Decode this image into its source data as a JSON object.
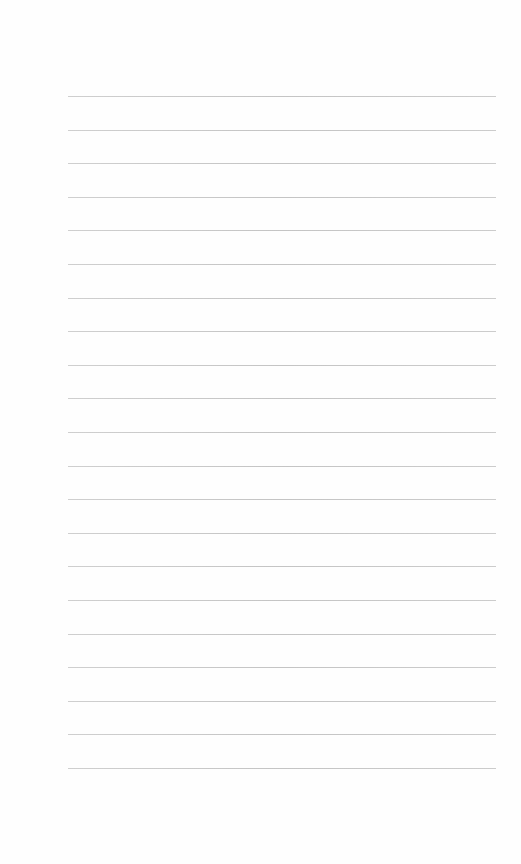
{
  "page": {
    "type": "blank-lined-page",
    "rule_color": "#c8c8c8",
    "background": "#ffffff",
    "rules": {
      "count": 21,
      "first_y": 96,
      "spacing": 33.6,
      "left": 68,
      "right": 496
    }
  }
}
